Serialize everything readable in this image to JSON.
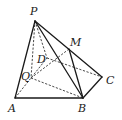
{
  "figure": {
    "type": "geometry-pyramid",
    "points": {
      "P": {
        "label": "P",
        "x": 35,
        "y": 21
      },
      "A": {
        "label": "A",
        "x": 15,
        "y": 98
      },
      "B": {
        "label": "B",
        "x": 83,
        "y": 98
      },
      "C": {
        "label": "C",
        "x": 102,
        "y": 77
      },
      "D": {
        "label": "D",
        "x": 47,
        "y": 58
      },
      "M": {
        "label": "M",
        "x": 69,
        "y": 49
      },
      "Q": {
        "label": "Q",
        "x": 31,
        "y": 78
      }
    },
    "solid_edges": [
      [
        "P",
        "A"
      ],
      [
        "P",
        "B"
      ],
      [
        "P",
        "C"
      ],
      [
        "A",
        "B"
      ],
      [
        "B",
        "C"
      ],
      [
        "M",
        "B"
      ]
    ],
    "dashed_edges": [
      [
        "P",
        "D"
      ],
      [
        "P",
        "Q"
      ],
      [
        "A",
        "D"
      ],
      [
        "D",
        "C"
      ],
      [
        "Q",
        "B"
      ],
      [
        "Q",
        "M"
      ]
    ],
    "colors": {
      "line": "#1a1a1a",
      "background": "#ffffff"
    }
  }
}
